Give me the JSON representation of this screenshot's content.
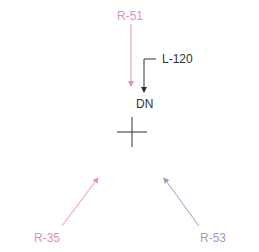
{
  "diagram": {
    "colors": {
      "pink": "#e88cc8",
      "hotpink": "#f28ab8",
      "periwinkle": "#9a9ad0",
      "dark": "#333333"
    },
    "labels": {
      "r51": "R-51",
      "l120": "L-120",
      "dn": "DN",
      "r35": "R-35",
      "r53": "R-53"
    }
  }
}
